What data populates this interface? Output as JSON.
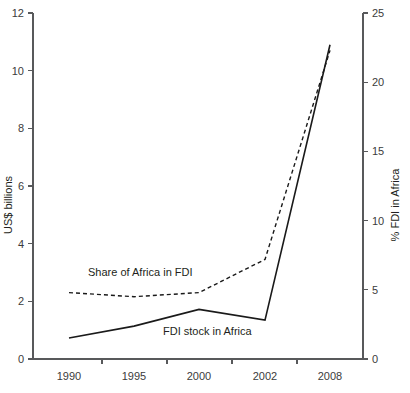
{
  "chart_data": {
    "type": "line",
    "title": "",
    "xlabel": "",
    "categories": [
      "1990",
      "1995",
      "2000",
      "2002",
      "2008"
    ],
    "grid": false,
    "legend_position": "inline-labels",
    "axes": {
      "left": {
        "label": "US$ billions",
        "ticks": [
          "0",
          "2",
          "4",
          "6",
          "8",
          "10",
          "12"
        ],
        "ylim": [
          0,
          12
        ]
      },
      "right": {
        "label": "% FDI in Africa",
        "ticks": [
          "0",
          "5",
          "10",
          "15",
          "20",
          "25"
        ],
        "ylim": [
          0,
          25
        ]
      }
    },
    "series": [
      {
        "name": "FDI stock in Africa",
        "axis": "left",
        "style": "solid",
        "units": "US$ billions",
        "values": [
          0.73,
          1.14,
          1.72,
          1.35,
          10.9
        ]
      },
      {
        "name": "Share of Africa in FDI",
        "axis": "right",
        "style": "dashed",
        "units": "% FDI in Africa",
        "values": [
          4.8,
          4.5,
          4.8,
          7.2,
          22.3
        ]
      }
    ],
    "annotations": [
      {
        "text": "Share of Africa in FDI",
        "series": "Share of Africa in FDI"
      },
      {
        "text": "FDI stock in Africa",
        "series": "FDI stock in Africa"
      }
    ],
    "colors": {
      "line": "#1a1a1a",
      "axis": "#58595b",
      "text": "#231f20",
      "background": "#ffffff"
    }
  }
}
